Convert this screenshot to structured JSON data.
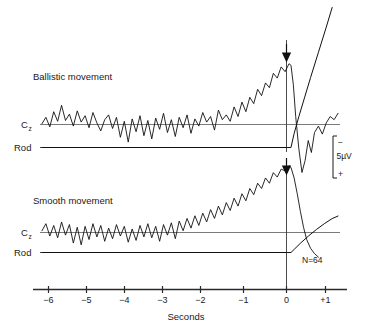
{
  "figure": {
    "background_color": "#ffffff",
    "ink_color": "#111111",
    "panels": [
      {
        "id": "ballistic",
        "title": "Ballistic movement",
        "channel_label": "C",
        "channel_subscript": "z",
        "rod_label": "Rod",
        "event_marker": "arrow-down"
      },
      {
        "id": "smooth",
        "title": "Smooth movement",
        "channel_label": "C",
        "channel_subscript": "z",
        "rod_label": "Rod",
        "event_marker": "arrow-down"
      }
    ],
    "scale_bar": {
      "negative_sign": "−",
      "value": "5µV",
      "positive_sign": "+"
    },
    "trial_count": "N=64"
  },
  "chart_data": {
    "type": "line",
    "title": "",
    "xlabel": "Seconds",
    "ylabel": "",
    "xlim": [
      -6.4,
      1.25
    ],
    "grid": false,
    "legend": "none",
    "annotations": [
      {
        "text": "Ballistic movement",
        "x": -5.6,
        "panel": "ballistic"
      },
      {
        "text": "Smooth movement",
        "x": -5.6,
        "panel": "smooth"
      },
      {
        "text": "N=64",
        "x": 0.55,
        "panel": "smooth"
      },
      {
        "text": "5µV",
        "x": 1.1,
        "panel": "scale"
      }
    ],
    "xticks": [
      -6,
      -5,
      -4,
      -3,
      -2,
      -1,
      0,
      1
    ],
    "xticklabels": [
      "−6",
      "−5",
      "−4",
      "−3",
      "−2",
      "−1",
      "0",
      "+1"
    ],
    "event_time": 0,
    "series": [
      {
        "name": "Ballistic movement Cz EEG",
        "panel": "ballistic",
        "units": "µV",
        "note": "readiness potential ramp begins ~−1.5 s, peak negativity at movement onset",
        "x": [
          -6.35,
          -6.25,
          -6.15,
          -6.05,
          -5.95,
          -5.85,
          -5.75,
          -5.65,
          -5.55,
          -5.45,
          -5.35,
          -5.25,
          -5.15,
          -5.05,
          -4.95,
          -4.85,
          -4.75,
          -4.65,
          -4.55,
          -4.45,
          -4.35,
          -4.25,
          -4.15,
          -4.05,
          -3.95,
          -3.85,
          -3.75,
          -3.65,
          -3.55,
          -3.45,
          -3.35,
          -3.25,
          -3.15,
          -3.05,
          -2.95,
          -2.85,
          -2.75,
          -2.65,
          -2.55,
          -2.45,
          -2.35,
          -2.25,
          -2.15,
          -2.05,
          -1.95,
          -1.85,
          -1.75,
          -1.65,
          -1.55,
          -1.45,
          -1.35,
          -1.25,
          -1.15,
          -1.05,
          -0.95,
          -0.85,
          -0.75,
          -0.65,
          -0.55,
          -0.45,
          -0.35,
          -0.25,
          -0.15,
          -0.05,
          0.0,
          0.06,
          0.12,
          0.2,
          0.28,
          0.36,
          0.44,
          0.52,
          0.6,
          0.7,
          0.8,
          0.9,
          1.0,
          1.1,
          1.2
        ],
        "y": [
          0.1,
          0.9,
          -0.3,
          1.6,
          0.4,
          2.4,
          0.5,
          1.3,
          -0.2,
          1.7,
          0.3,
          1.1,
          -0.4,
          1.5,
          0.2,
          -0.8,
          0.6,
          1.2,
          -0.5,
          0.9,
          -1.6,
          0.4,
          -2.2,
          0.7,
          -0.9,
          1.1,
          -1.4,
          0.5,
          -1.8,
          0.8,
          -0.6,
          1.4,
          -1.0,
          0.6,
          -1.5,
          0.9,
          -0.4,
          1.2,
          -1.1,
          0.7,
          -0.2,
          1.5,
          0.3,
          1.0,
          -0.7,
          1.8,
          0.6,
          1.2,
          0.4,
          2.2,
          1.0,
          2.8,
          1.6,
          3.4,
          2.6,
          4.4,
          3.6,
          5.2,
          4.6,
          6.4,
          5.8,
          7.2,
          6.6,
          7.6,
          7.4,
          5.0,
          1.0,
          -3.0,
          -6.0,
          -4.5,
          -2.0,
          -3.5,
          -1.0,
          -0.2,
          -1.2,
          0.2,
          1.0,
          0.6,
          1.4
        ]
      },
      {
        "name": "Ballistic movement rod position",
        "panel": "ballistic",
        "units": "displacement",
        "note": "flat before onset, rises steeply off-scale after movement",
        "x": [
          -6.35,
          -0.1,
          0.0,
          0.08,
          0.2,
          0.35,
          0.5,
          0.7,
          0.9,
          1.05
        ],
        "y": [
          0,
          0,
          0,
          2.5,
          5.5,
          9.0,
          12.5,
          17.0,
          21.5,
          25.0
        ]
      },
      {
        "name": "Smooth movement Cz EEG",
        "panel": "smooth",
        "units": "µV",
        "note": "slower ramp beginning ~−2.3 s, rounded peak at onset then gradual return",
        "x": [
          -6.35,
          -6.25,
          -6.15,
          -6.05,
          -5.95,
          -5.85,
          -5.75,
          -5.65,
          -5.55,
          -5.45,
          -5.35,
          -5.25,
          -5.15,
          -5.05,
          -4.95,
          -4.85,
          -4.75,
          -4.65,
          -4.55,
          -4.45,
          -4.35,
          -4.25,
          -4.15,
          -4.05,
          -3.95,
          -3.85,
          -3.75,
          -3.65,
          -3.55,
          -3.45,
          -3.35,
          -3.25,
          -3.15,
          -3.05,
          -2.95,
          -2.85,
          -2.75,
          -2.65,
          -2.55,
          -2.45,
          -2.35,
          -2.25,
          -2.15,
          -2.05,
          -1.95,
          -1.85,
          -1.75,
          -1.65,
          -1.55,
          -1.45,
          -1.35,
          -1.25,
          -1.15,
          -1.05,
          -0.95,
          -0.85,
          -0.75,
          -0.65,
          -0.55,
          -0.45,
          -0.35,
          -0.25,
          -0.15,
          -0.05,
          0.0,
          0.08,
          0.16,
          0.24,
          0.32,
          0.4,
          0.5,
          0.6,
          0.7
        ],
        "y": [
          0.2,
          1.0,
          -0.4,
          0.8,
          -0.6,
          1.2,
          -0.3,
          0.9,
          -1.2,
          0.6,
          -1.4,
          0.7,
          -0.8,
          1.0,
          -0.5,
          0.8,
          -1.0,
          0.5,
          -0.7,
          0.9,
          -0.4,
          0.7,
          -1.1,
          0.4,
          -0.9,
          0.8,
          -0.5,
          1.0,
          -0.6,
          0.7,
          -1.0,
          0.9,
          -0.3,
          1.1,
          -0.7,
          1.3,
          0.2,
          1.6,
          0.5,
          1.9,
          0.8,
          2.2,
          1.2,
          2.6,
          1.6,
          3.0,
          2.0,
          3.4,
          2.5,
          3.9,
          3.0,
          4.4,
          3.6,
          5.0,
          4.3,
          5.6,
          5.0,
          6.2,
          5.6,
          6.8,
          6.3,
          7.2,
          7.0,
          7.6,
          7.4,
          6.2,
          4.4,
          2.4,
          0.6,
          -0.8,
          -1.8,
          -2.4,
          -2.8
        ]
      },
      {
        "name": "Smooth movement rod position",
        "panel": "smooth",
        "units": "displacement",
        "note": "flat before onset, slow gradual rise after movement",
        "x": [
          -6.35,
          -0.1,
          0.0,
          0.1,
          0.25,
          0.45,
          0.65,
          0.85,
          1.05,
          1.2
        ],
        "y": [
          0,
          0,
          0,
          1.2,
          3.0,
          5.2,
          7.2,
          9.0,
          10.6,
          11.4
        ]
      }
    ]
  }
}
